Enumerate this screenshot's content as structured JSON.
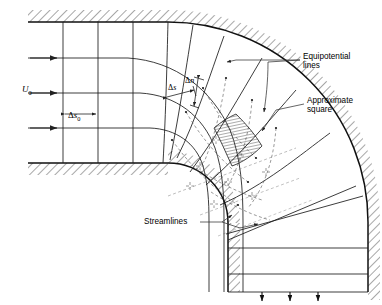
{
  "figure": {
    "type": "flow-net-diagram",
    "background": "#ffffff",
    "line_color": "#1a1a1a",
    "dashed_color": "#555555",
    "wall_hatch_color": "#333333"
  },
  "labels": {
    "inlet_velocity": {
      "base": "U",
      "sub": "0"
    },
    "delta_s0": {
      "delta": "Δ",
      "base": "s",
      "sub": "0"
    },
    "delta_s": {
      "delta": "Δ",
      "base": "s",
      "sub": ""
    },
    "delta_n": {
      "delta": "Δ",
      "base": "n",
      "sub": ""
    },
    "equipotential_line1": "Equipotential",
    "equipotential_line2": "lines",
    "approximate_line1": "Approximate",
    "approximate_line2": "square",
    "streamlines": "Streamlines"
  },
  "geometry": {
    "inlet_arrow_count": 3,
    "outlet_arrow_count": 3,
    "streamline_count": 4,
    "equipotential_count": 9,
    "bend_angle_degrees": 90,
    "inner_radius": 60,
    "outer_radius": 200
  }
}
